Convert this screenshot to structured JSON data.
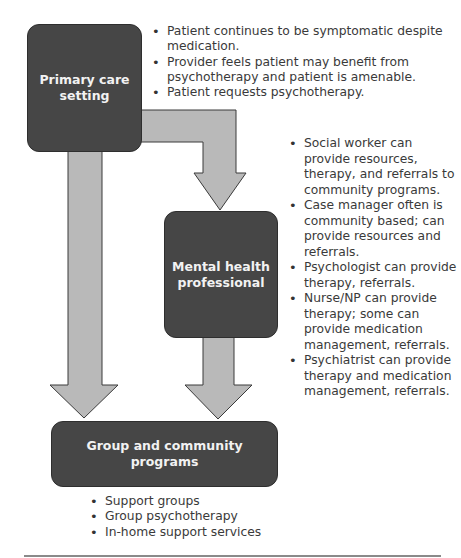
{
  "diagram": {
    "colors": {
      "box_fill": "#464646",
      "arrow_fill": "#b9b9b9",
      "arrow_stroke": "#3a3a3a",
      "text": "#3a3a3a",
      "box_text": "#f2f2f2"
    },
    "nodes": {
      "primary_care": {
        "label_line1": "Primary care",
        "label_line2": "setting"
      },
      "mental_health": {
        "label_line1": "Mental health",
        "label_line2": "professional"
      },
      "group_community": {
        "label": "Group and community programs"
      }
    },
    "primary_care_notes": [
      "Patient continues to be symptomatic despite medication.",
      "Provider feels patient may benefit from psychotherapy and patient is amenable.",
      "Patient requests psychotherapy."
    ],
    "mental_health_notes": [
      "Social worker can provide resources, therapy, and referrals to community programs.",
      "Case manager often is community based; can provide resources and referrals.",
      "Psychologist can provide therapy, referrals.",
      "Nurse/NP can provide therapy; some can provide medication management, referrals.",
      "Psychiatrist can provide therapy and medication management, referrals."
    ],
    "group_community_notes": [
      "Support groups",
      "Group psychotherapy",
      "In-home support services"
    ],
    "edges": [
      {
        "from": "Primary care setting",
        "to": "Mental health professional"
      },
      {
        "from": "Primary care setting",
        "to": "Group and community programs"
      },
      {
        "from": "Mental health professional",
        "to": "Group and community programs"
      }
    ]
  }
}
